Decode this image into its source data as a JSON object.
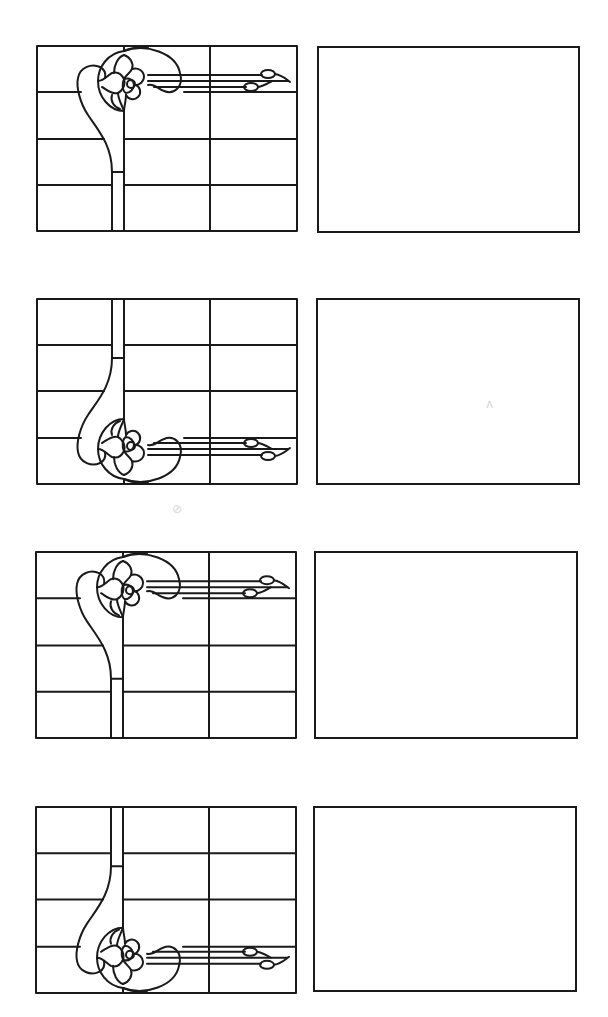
{
  "sheet": {
    "description": "Stained-glass design worksheet: four rows, each pairing a leaded-glass design with an empty frame",
    "stroke_color": "#1a1a1a",
    "background": "#ffffff"
  },
  "rows": [
    {
      "index": 1,
      "design": {
        "variant": "flower-top",
        "grid": {
          "columns": 3,
          "rows": 4
        },
        "box": {
          "x": 36,
          "y": 45,
          "w": 262,
          "h": 187
        }
      },
      "blank_frame": {
        "box": {
          "x": 317,
          "y": 46,
          "w": 263,
          "h": 187
        }
      }
    },
    {
      "index": 2,
      "design": {
        "variant": "flower-bottom",
        "grid": {
          "columns": 3,
          "rows": 4
        },
        "box": {
          "x": 36,
          "y": 298,
          "w": 262,
          "h": 187
        }
      },
      "blank_frame": {
        "box": {
          "x": 316,
          "y": 298,
          "w": 264,
          "h": 187
        }
      }
    },
    {
      "index": 3,
      "design": {
        "variant": "flower-top",
        "grid": {
          "columns": 3,
          "rows": 4
        },
        "box": {
          "x": 35,
          "y": 551,
          "w": 262,
          "h": 188
        }
      },
      "blank_frame": {
        "box": {
          "x": 314,
          "y": 551,
          "w": 264,
          "h": 188
        }
      }
    },
    {
      "index": 4,
      "design": {
        "variant": "flower-bottom",
        "grid": {
          "columns": 3,
          "rows": 4
        },
        "box": {
          "x": 35,
          "y": 806,
          "w": 262,
          "h": 188
        }
      },
      "blank_frame": {
        "box": {
          "x": 313,
          "y": 806,
          "w": 264,
          "h": 186
        }
      }
    }
  ],
  "scan_marks": [
    {
      "glyph": "ᴧ",
      "x": 486,
      "y": 398
    },
    {
      "glyph": "⊘",
      "x": 172,
      "y": 503
    }
  ]
}
